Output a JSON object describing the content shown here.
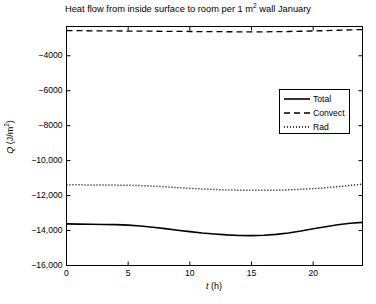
{
  "chart_data": {
    "type": "line",
    "title_main": "Heat flow from inside surface to room per 1 m",
    "title_sup": "2",
    "title_tail": " wall January",
    "xlabel": "t (h)",
    "xlabel_var": "t",
    "xlabel_unit": " (h)",
    "ylabel": "Q (J/m²)",
    "ylabel_var": "Q",
    "ylabel_unit_pre": " (J/m",
    "ylabel_unit_sup": "2",
    "ylabel_unit_post": ")",
    "xlim": [
      0,
      24
    ],
    "ylim": [
      -16000,
      -2325
    ],
    "xticks": [
      0,
      5,
      10,
      15,
      20
    ],
    "xtick_labels": [
      "0",
      "5",
      "10",
      "15",
      "20"
    ],
    "yticks": [
      -4000,
      -6000,
      -8000,
      -10000,
      -12000,
      -14000,
      -16000
    ],
    "ytick_labels": [
      "−4000",
      "−6000",
      "−8000",
      "−10,000",
      "−12,000",
      "−14,000",
      "−16,000"
    ],
    "grid": false,
    "legend_position": "center-right",
    "line_color": "#000000",
    "background_color": "#ffffff",
    "x": [
      0,
      1,
      2,
      3,
      4,
      5,
      6,
      7,
      8,
      9,
      10,
      11,
      12,
      13,
      14,
      15,
      16,
      17,
      18,
      19,
      20,
      21,
      22,
      23,
      24
    ],
    "series": [
      {
        "name": "Total",
        "style": "solid",
        "values": [
          -13620,
          -13630,
          -13640,
          -13650,
          -13660,
          -13690,
          -13740,
          -13810,
          -13890,
          -13980,
          -14060,
          -14140,
          -14200,
          -14250,
          -14280,
          -14290,
          -14270,
          -14220,
          -14140,
          -14030,
          -13900,
          -13780,
          -13670,
          -13580,
          -13530
        ]
      },
      {
        "name": "Convect",
        "style": "dashed",
        "values": [
          -2560,
          -2565,
          -2570,
          -2575,
          -2580,
          -2585,
          -2590,
          -2595,
          -2600,
          -2605,
          -2610,
          -2615,
          -2620,
          -2625,
          -2628,
          -2630,
          -2628,
          -2622,
          -2612,
          -2598,
          -2582,
          -2562,
          -2540,
          -2518,
          -2500
        ]
      },
      {
        "name": "Rad",
        "style": "dotted",
        "values": [
          -11380,
          -11385,
          -11390,
          -11395,
          -11400,
          -11410,
          -11430,
          -11460,
          -11500,
          -11545,
          -11585,
          -11620,
          -11650,
          -11675,
          -11690,
          -11700,
          -11700,
          -11690,
          -11670,
          -11640,
          -11600,
          -11550,
          -11490,
          -11420,
          -11350
        ]
      }
    ]
  },
  "legend": {
    "items": [
      {
        "label": "Total",
        "style": "solid"
      },
      {
        "label": "Convect",
        "style": "dashed"
      },
      {
        "label": "Rad",
        "style": "dotted"
      }
    ]
  }
}
